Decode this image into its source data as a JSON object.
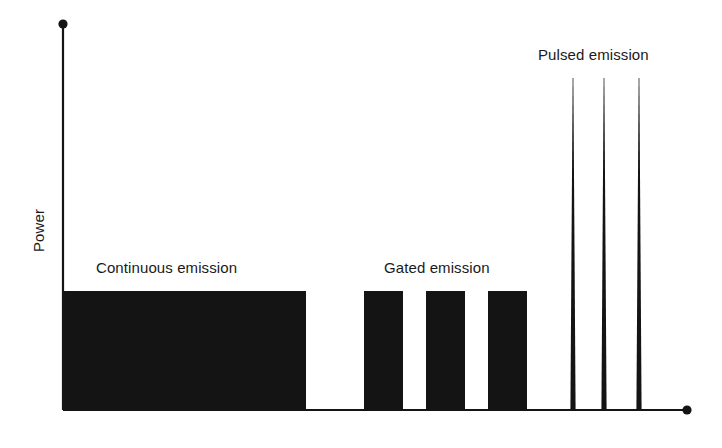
{
  "figure": {
    "background_color": "#ffffff",
    "ink_color": "#141414",
    "width": 722,
    "height": 448
  },
  "axes": {
    "y_axis": {
      "label": "Power",
      "label_rotation_deg": -90,
      "has_end_dot": true,
      "x": 63,
      "top_y": 24,
      "bottom_y": 410
    },
    "x_axis": {
      "label": "",
      "has_end_dot": true,
      "y": 410,
      "left_x": 63,
      "right_x": 687
    }
  },
  "annotations": [
    {
      "name": "continuous-emission-label",
      "text": "Continuous emission",
      "x": 96,
      "y": 259
    },
    {
      "name": "gated-emission-label",
      "text": "Gated emission",
      "x": 384,
      "y": 259
    },
    {
      "name": "pulsed-emission-label",
      "text": "Pulsed emission",
      "x": 538,
      "y": 46
    }
  ],
  "chart_data": {
    "type": "area",
    "title": "",
    "xlabel": "",
    "ylabel": "Power",
    "grid": false,
    "legend": "none",
    "xlim": [
      0,
      624
    ],
    "ylim": [
      0,
      386
    ],
    "axis_origin_px": {
      "x": 63,
      "y": 410
    },
    "regimes": [
      {
        "name": "Continuous emission",
        "shape": "rectangle",
        "count": 1,
        "power_level": 119,
        "blocks": [
          {
            "x_start": 63,
            "x_end": 306,
            "top_y": 291,
            "bottom_y": 410
          }
        ]
      },
      {
        "name": "Gated emission",
        "shape": "rectangle",
        "count": 3,
        "power_level": 119,
        "blocks": [
          {
            "x_start": 364,
            "x_end": 403,
            "top_y": 291,
            "bottom_y": 410
          },
          {
            "x_start": 426,
            "x_end": 465,
            "top_y": 291,
            "bottom_y": 410
          },
          {
            "x_start": 488,
            "x_end": 527,
            "top_y": 291,
            "bottom_y": 410
          }
        ]
      },
      {
        "name": "Pulsed emission",
        "shape": "spike",
        "count": 3,
        "power_level": 332,
        "blocks": [
          {
            "center_x": 573,
            "base_half_width": 2.6,
            "tip_y": 78,
            "bottom_y": 410
          },
          {
            "center_x": 604,
            "base_half_width": 2.6,
            "tip_y": 78,
            "bottom_y": 410
          },
          {
            "center_x": 639,
            "base_half_width": 2.6,
            "tip_y": 78,
            "bottom_y": 410
          }
        ]
      }
    ]
  }
}
